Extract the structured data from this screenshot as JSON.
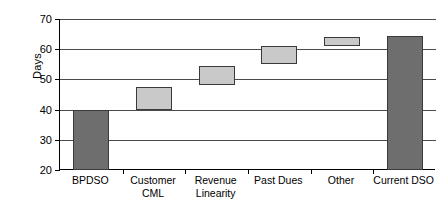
{
  "chart_data": {
    "type": "bar",
    "subtype": "waterfall",
    "title": "",
    "xlabel": "",
    "ylabel": "Days",
    "ylim": [
      20,
      70
    ],
    "yticks": [
      20,
      30,
      40,
      50,
      60,
      70
    ],
    "ytick_labels": [
      "20",
      "30",
      "40",
      "50",
      "60",
      "70"
    ],
    "grid": true,
    "legend": false,
    "categories": [
      "BPDSO",
      "Customer CML",
      "Revenue Linearity",
      "Past Dues",
      "Other",
      "Current DSO"
    ],
    "category_label_lines": [
      [
        "BPDSO"
      ],
      [
        "Customer",
        "CML"
      ],
      [
        "Revenue",
        "Linearity"
      ],
      [
        "Past Dues"
      ],
      [
        "Other"
      ],
      [
        "Current DSO"
      ]
    ],
    "bars": [
      {
        "label": "BPDSO",
        "base": 20,
        "top": 40,
        "value": 20,
        "kind": "total",
        "color": "#6e6e6e"
      },
      {
        "label": "Customer CML",
        "base": 40,
        "top": 47.5,
        "value": 7.5,
        "kind": "delta",
        "color": "#c9c9c9"
      },
      {
        "label": "Revenue Linearity",
        "base": 48,
        "top": 54.5,
        "value": 6.5,
        "kind": "delta",
        "color": "#c9c9c9"
      },
      {
        "label": "Past Dues",
        "base": 55,
        "top": 61,
        "value": 6,
        "kind": "delta",
        "color": "#c9c9c9"
      },
      {
        "label": "Other",
        "base": 61,
        "top": 64,
        "value": 3,
        "kind": "delta",
        "color": "#c9c9c9"
      },
      {
        "label": "Current DSO",
        "base": 20,
        "top": 64.5,
        "value": 44.5,
        "kind": "total",
        "color": "#6e6e6e"
      }
    ],
    "colors": {
      "total_bar": "#6e6e6e",
      "delta_bar": "#c9c9c9",
      "bar_border": "#3a3a3a",
      "gridline": "#4a4a4a",
      "axis": "#000000",
      "background": "#ffffff"
    }
  }
}
